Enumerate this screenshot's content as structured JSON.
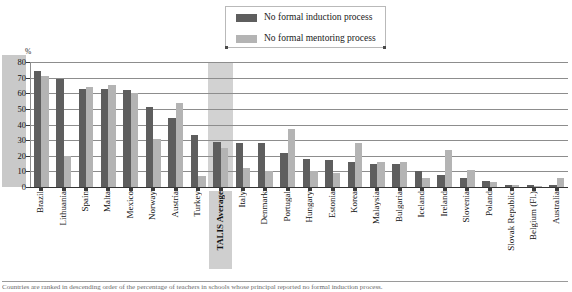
{
  "legend": {
    "items": [
      {
        "label": "No formal induction process",
        "color": "#5e5e5e",
        "icon": "legend-swatch-dark"
      },
      {
        "label": "No formal mentoring process",
        "color": "#b4b4b4",
        "icon": "legend-swatch-light"
      }
    ]
  },
  "axis": {
    "y_unit": "%",
    "y_ticks": [
      "0",
      "10",
      "20",
      "30",
      "40",
      "50",
      "60",
      "70",
      "80"
    ]
  },
  "footnote": "Countries are ranked in descending order of the percentage of teachers in schools whose principal reported no formal induction process.",
  "chart_data": {
    "type": "bar",
    "title": "",
    "xlabel": "",
    "ylabel": "%",
    "ylim": [
      0,
      80
    ],
    "grid": true,
    "legend_position": "top-center",
    "highlight_category": "TALIS Average",
    "categories": [
      "Brazil",
      "Lithuania",
      "Spain",
      "Malta",
      "Mexico",
      "Norway",
      "Austria",
      "Turkey",
      "TALIS Average",
      "Italy",
      "Denmark",
      "Portugal",
      "Hungary",
      "Estonia",
      "Korea",
      "Malaysia",
      "Bulgaria",
      "Iceland",
      "Ireland",
      "Slovenia",
      "Poland",
      "Slovak Republic",
      "Belgium (Fl.)",
      "Australia"
    ],
    "series": [
      {
        "name": "No formal induction process",
        "color": "#5e5e5e",
        "values": [
          74,
          69,
          63,
          63,
          62,
          51,
          44,
          33,
          29,
          28,
          28,
          22,
          18,
          17,
          16,
          15,
          15,
          10,
          8,
          6,
          4,
          1.5,
          1,
          1
        ]
      },
      {
        "name": "No formal mentoring process",
        "color": "#b4b4b4",
        "values": [
          71,
          20,
          64,
          65,
          60,
          31,
          54,
          7,
          25,
          12,
          10,
          37,
          10,
          9,
          28,
          16,
          16,
          6,
          24,
          11,
          3,
          1,
          0.5,
          6
        ]
      }
    ]
  }
}
